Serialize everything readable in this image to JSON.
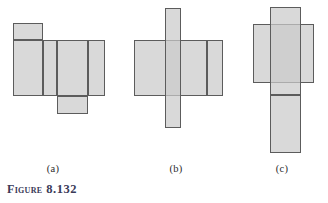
{
  "figure": {
    "title_word": "Figure",
    "number": "8.132",
    "fill_color": "#cbcbcb",
    "stroke_color": "#5c5c5c",
    "background_color": "#ffffff",
    "caption_color": "#3a3a58"
  },
  "panels": [
    {
      "id": "a",
      "label": "(a)",
      "label_x": 53,
      "label_y": 163,
      "rects": [
        {
          "name": "panel-a-top-flap",
          "x": 13,
          "y": 23,
          "w": 30,
          "h": 17
        },
        {
          "name": "panel-a-left-face",
          "x": 13,
          "y": 40,
          "w": 30,
          "h": 56
        },
        {
          "name": "panel-a-middle-face",
          "x": 43,
          "y": 40,
          "w": 14,
          "h": 56
        },
        {
          "name": "panel-a-right-face",
          "x": 57,
          "y": 40,
          "w": 31,
          "h": 56
        },
        {
          "name": "panel-a-far-right",
          "x": 88,
          "y": 40,
          "w": 17,
          "h": 56
        },
        {
          "name": "panel-a-bottom-flap",
          "x": 57,
          "y": 96,
          "w": 31,
          "h": 18
        }
      ]
    },
    {
      "id": "b",
      "label": "(b)",
      "label_x": 176,
      "label_y": 163,
      "rects": [
        {
          "name": "panel-b-left-face",
          "x": 134,
          "y": 40,
          "w": 73,
          "h": 56
        },
        {
          "name": "panel-b-right-face",
          "x": 207,
          "y": 40,
          "w": 16,
          "h": 56
        },
        {
          "name": "panel-b-vertical-strip",
          "x": 165,
          "y": 8,
          "w": 16,
          "h": 120
        }
      ]
    },
    {
      "id": "c",
      "label": "(c)",
      "label_x": 282,
      "label_y": 163,
      "rects": [
        {
          "name": "panel-c-horizontal-face",
          "x": 253,
          "y": 24,
          "w": 61,
          "h": 59
        },
        {
          "name": "panel-c-vertical-upper",
          "x": 270,
          "y": 7,
          "w": 31,
          "h": 88
        },
        {
          "name": "panel-c-vertical-lower",
          "x": 270,
          "y": 95,
          "w": 31,
          "h": 58
        }
      ]
    }
  ]
}
